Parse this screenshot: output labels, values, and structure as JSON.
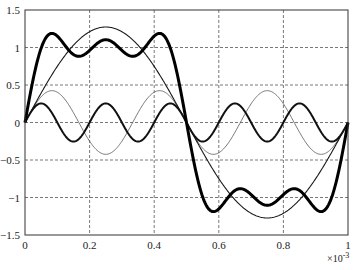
{
  "chart_data": {
    "type": "line",
    "title": "",
    "xlabel": "",
    "ylabel": "",
    "x_multiplier_label": "×10",
    "x_multiplier_exponent": "-3",
    "xlim": [
      0,
      1
    ],
    "ylim": [
      -1.5,
      1.5
    ],
    "grid": true,
    "legend": null,
    "x_ticks": [
      0,
      0.2,
      0.4,
      0.6,
      0.8,
      1
    ],
    "x_tick_labels": [
      "0",
      "0.2",
      "0.4",
      "0.6",
      "0.8",
      "1"
    ],
    "y_ticks": [
      1.5,
      1,
      0.5,
      0,
      -0.5,
      -1,
      -1.5
    ],
    "y_tick_labels": [
      "1.5",
      "1",
      "0.5",
      "0",
      "−0.5",
      "−1",
      "−1.5"
    ],
    "x_unit_scale": 0.001,
    "series": [
      {
        "name": "fundamental (n=1)",
        "description": "(4/π)·sin(2π·1·x/T)",
        "harmonics": [
          1
        ],
        "amplitude": 1.273,
        "stroke_width": 1.1,
        "color": "#1a1a1a",
        "x": [
          0,
          0.1,
          0.2,
          0.25,
          0.3,
          0.4,
          0.5,
          0.6,
          0.7,
          0.75,
          0.8,
          0.9,
          1.0
        ],
        "values": [
          0,
          0.75,
          1.21,
          1.27,
          1.21,
          0.75,
          0,
          -0.75,
          -1.21,
          -1.27,
          -1.21,
          -0.75,
          0
        ]
      },
      {
        "name": "3rd harmonic",
        "description": "(4/3π)·sin(2π·3·x/T)",
        "harmonics": [
          3
        ],
        "amplitude": 0.424,
        "stroke_width": 0.8,
        "color": "#555555",
        "x": [
          0,
          0.0833,
          0.1667,
          0.25,
          0.3333,
          0.4167,
          0.5,
          0.5833,
          0.6667,
          0.75,
          0.8333,
          0.9167,
          1.0
        ],
        "values": [
          0,
          0.42,
          0,
          -0.42,
          0,
          0.42,
          0,
          -0.42,
          0,
          0.42,
          0,
          -0.42,
          0
        ]
      },
      {
        "name": "5th harmonic",
        "description": "(4/5π)·sin(2π·5·x/T)",
        "harmonics": [
          5
        ],
        "amplitude": 0.255,
        "stroke_width": 2.0,
        "color": "#111111",
        "x": [
          0,
          0.05,
          0.1,
          0.15,
          0.2,
          0.25,
          0.3,
          0.35,
          0.4,
          0.45,
          0.5,
          0.55,
          0.6,
          0.65,
          0.7,
          0.75,
          0.8,
          0.85,
          0.9,
          0.95,
          1.0
        ],
        "values": [
          0,
          0.25,
          0,
          -0.25,
          0,
          0.25,
          0,
          -0.25,
          0,
          0.25,
          0,
          -0.25,
          0,
          0.25,
          0,
          -0.25,
          0,
          0.25,
          0,
          -0.25,
          0
        ]
      },
      {
        "name": "sum of harmonics 1+3+5",
        "description": "(4/π)·Σ sin(2π·n·x/T)/n, n=1,3,5",
        "harmonics": [
          1,
          3,
          5
        ],
        "amplitude": 1.0,
        "stroke_width": 3.0,
        "color": "#000000",
        "x": [
          0,
          0.07,
          0.15,
          0.25,
          0.35,
          0.43,
          0.5,
          0.57,
          0.65,
          0.75,
          0.85,
          0.93,
          1.0
        ],
        "values": [
          0,
          1.18,
          0.88,
          1.1,
          0.88,
          1.18,
          0,
          -1.18,
          -0.88,
          -1.1,
          -0.88,
          -1.18,
          0
        ]
      }
    ]
  }
}
